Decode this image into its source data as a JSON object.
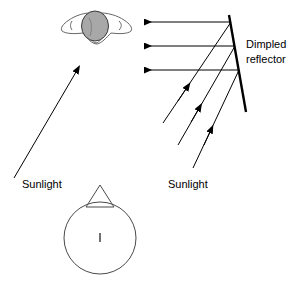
{
  "diagram": {
    "background_color": "#ffffff",
    "line_color": "#000000",
    "head_fill_color": "#a8a8a8",
    "body_stroke_color": "#4a4a4a",
    "width": 297,
    "height": 293
  },
  "labels": {
    "reflector_line1": "Dimpled",
    "reflector_line2": "reflector",
    "sunlight_left": "Sunlight",
    "sunlight_right": "Sunlight",
    "body_center_mark": "I"
  },
  "elements": {
    "reflector": {
      "name": "Dimpled reflector",
      "x1": 229,
      "y1": 15,
      "x2": 246,
      "y2": 112
    },
    "reflected_rays": [
      {
        "from_x": 231,
        "from_y": 22,
        "to_x": 144,
        "to_y": 22,
        "direction": "left"
      },
      {
        "from_x": 235,
        "from_y": 46,
        "to_x": 144,
        "to_y": 46,
        "direction": "left"
      },
      {
        "from_x": 239,
        "from_y": 70,
        "to_x": 144,
        "to_y": 70,
        "direction": "left"
      }
    ],
    "incident_rays": [
      {
        "from_x": 163,
        "from_y": 123,
        "to_x": 231,
        "to_y": 22,
        "direction": "up-right"
      },
      {
        "from_x": 178,
        "from_y": 145,
        "to_x": 235,
        "to_y": 46,
        "direction": "up-right"
      },
      {
        "from_x": 193,
        "from_y": 168,
        "to_x": 239,
        "to_y": 70,
        "direction": "up-right"
      }
    ],
    "sunlight_ray_left": {
      "from_x": 14,
      "from_y": 178,
      "to_x": 76,
      "to_y": 72,
      "direction": "up-right"
    },
    "person_top_view": {
      "head_cx": 95,
      "head_cy": 26,
      "head_rx": 13,
      "head_ry": 15
    },
    "body_circle": {
      "cx": 100,
      "cy": 238,
      "r": 36
    },
    "body_triangle": {
      "apex_x": 100,
      "apex_y": 185,
      "left_x": 86,
      "left_y": 207,
      "right_x": 114,
      "right_y": 207
    }
  }
}
